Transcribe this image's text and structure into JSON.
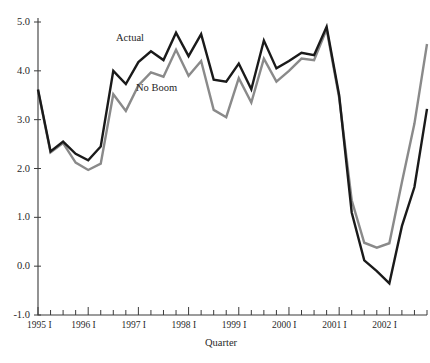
{
  "chart_data": {
    "type": "line",
    "title": "",
    "xlabel": "Quarter",
    "ylabel": "",
    "ylim": [
      -1.0,
      5.0
    ],
    "ytick_labels": [
      "5.0",
      "4.0",
      "3.0",
      "2.0",
      "1.0",
      "0.0",
      "-1.0"
    ],
    "ytick_values": [
      5.0,
      4.0,
      3.0,
      2.0,
      1.0,
      0.0,
      -1.0
    ],
    "grid": false,
    "legend": "inline-annotations",
    "xtick_labels": [
      "1995 I",
      "1996 I",
      "1997 I",
      "1998 I",
      "1999 I",
      "2000 I",
      "2001 I",
      "2002 I"
    ],
    "x": [
      "1995 I",
      "1995 II",
      "1995 III",
      "1995 IV",
      "1996 I",
      "1996 II",
      "1996 III",
      "1996 IV",
      "1997 I",
      "1997 II",
      "1997 III",
      "1997 IV",
      "1998 I",
      "1998 II",
      "1998 III",
      "1998 IV",
      "1999 I",
      "1999 II",
      "1999 III",
      "1999 IV",
      "2000 I",
      "2000 II",
      "2000 III",
      "2000 IV",
      "2001 I",
      "2001 II",
      "2001 III",
      "2001 IV",
      "2002 I",
      "2002 II",
      "2002 III",
      "2002 IV"
    ],
    "series": [
      {
        "name": "Actual",
        "color": "#1a1a1a",
        "values": [
          3.62,
          2.35,
          2.55,
          2.3,
          2.17,
          2.45,
          4.0,
          3.73,
          4.18,
          4.4,
          4.22,
          4.78,
          4.3,
          4.75,
          3.82,
          3.78,
          4.15,
          3.62,
          4.62,
          4.05,
          4.2,
          4.37,
          4.32,
          4.9,
          3.5,
          1.1,
          0.12,
          -0.1,
          -0.35,
          0.82,
          1.62,
          3.22
        ]
      },
      {
        "name": "No Boom",
        "color": "#8a8a8a",
        "values": [
          3.6,
          2.33,
          2.52,
          2.12,
          1.97,
          2.1,
          3.52,
          3.18,
          3.7,
          3.97,
          3.88,
          4.43,
          3.9,
          4.2,
          3.2,
          3.05,
          3.85,
          3.35,
          4.25,
          3.78,
          4.0,
          4.25,
          4.22,
          4.85,
          3.45,
          1.35,
          0.48,
          0.38,
          0.47,
          1.72,
          2.92,
          4.55
        ]
      }
    ],
    "annotations": [
      {
        "text": "Actual",
        "series": "Actual"
      },
      {
        "text": "No Boom",
        "series": "No Boom"
      }
    ]
  },
  "axes": {
    "x_title": "Quarter"
  }
}
